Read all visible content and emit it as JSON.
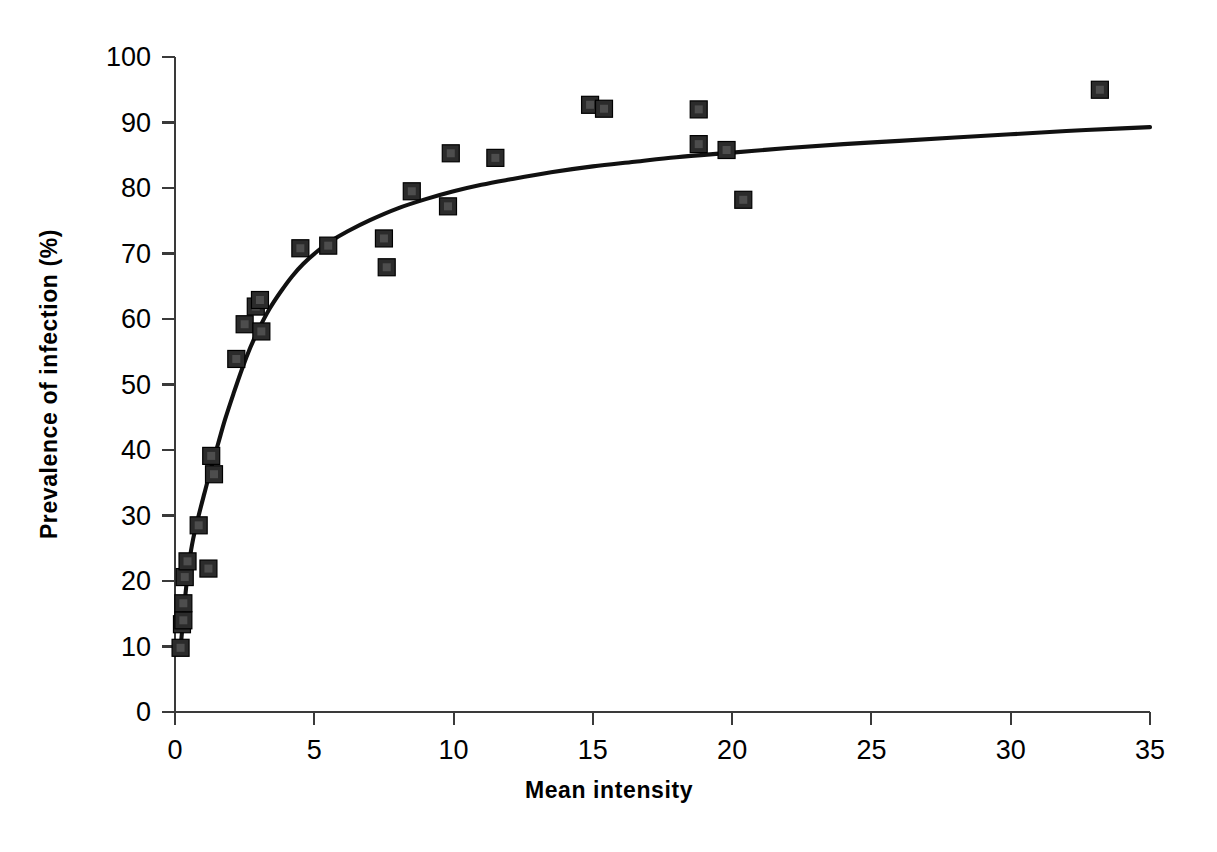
{
  "chart_data": {
    "type": "scatter",
    "title": "",
    "xlabel": "Mean intensity",
    "ylabel": "Prevalence of infection (%)",
    "xlim": [
      0,
      35
    ],
    "ylim": [
      0,
      100
    ],
    "xticks": [
      0,
      5,
      10,
      15,
      20,
      25,
      30,
      35
    ],
    "yticks": [
      0,
      10,
      20,
      30,
      40,
      50,
      60,
      70,
      80,
      90,
      100
    ],
    "xtick_labels": [
      "0",
      "5",
      "10",
      "15",
      "20",
      "25",
      "30",
      "35"
    ],
    "ytick_labels": [
      "0",
      "10",
      "20",
      "30",
      "40",
      "50",
      "60",
      "70",
      "80",
      "90",
      "100"
    ],
    "grid": false,
    "legend": null,
    "marker_style": "filled-square",
    "marker_color": "#2b2b2b",
    "curve_color": "#111111",
    "series": [
      {
        "name": "Observed sites",
        "type": "scatter",
        "points": [
          {
            "x": 0.2,
            "y": 9.8
          },
          {
            "x": 0.25,
            "y": 13.4
          },
          {
            "x": 0.3,
            "y": 14.0
          },
          {
            "x": 0.3,
            "y": 16.6
          },
          {
            "x": 0.35,
            "y": 20.6
          },
          {
            "x": 0.45,
            "y": 23.0
          },
          {
            "x": 0.85,
            "y": 28.5
          },
          {
            "x": 1.2,
            "y": 21.9
          },
          {
            "x": 1.3,
            "y": 39.1
          },
          {
            "x": 1.4,
            "y": 36.3
          },
          {
            "x": 2.2,
            "y": 53.9
          },
          {
            "x": 2.5,
            "y": 59.2
          },
          {
            "x": 2.9,
            "y": 61.9
          },
          {
            "x": 3.05,
            "y": 62.9
          },
          {
            "x": 3.1,
            "y": 58.1
          },
          {
            "x": 4.5,
            "y": 70.8
          },
          {
            "x": 5.5,
            "y": 71.2
          },
          {
            "x": 7.5,
            "y": 72.3
          },
          {
            "x": 7.6,
            "y": 67.9
          },
          {
            "x": 8.5,
            "y": 79.5
          },
          {
            "x": 9.8,
            "y": 77.2
          },
          {
            "x": 9.9,
            "y": 85.3
          },
          {
            "x": 11.5,
            "y": 84.6
          },
          {
            "x": 14.9,
            "y": 92.7
          },
          {
            "x": 15.4,
            "y": 92.1
          },
          {
            "x": 18.8,
            "y": 92.0
          },
          {
            "x": 18.8,
            "y": 86.7
          },
          {
            "x": 19.8,
            "y": 85.8
          },
          {
            "x": 20.4,
            "y": 78.2
          },
          {
            "x": 33.2,
            "y": 95.0
          }
        ]
      },
      {
        "name": "Fitted curve",
        "type": "line",
        "points": [
          {
            "x": 0.2,
            "y": 9.8
          },
          {
            "x": 0.3,
            "y": 14.5
          },
          {
            "x": 0.4,
            "y": 19.0
          },
          {
            "x": 0.5,
            "y": 22.6
          },
          {
            "x": 0.65,
            "y": 26.4
          },
          {
            "x": 0.85,
            "y": 30.0
          },
          {
            "x": 1.05,
            "y": 33.3
          },
          {
            "x": 1.3,
            "y": 37.3
          },
          {
            "x": 1.55,
            "y": 41.0
          },
          {
            "x": 1.8,
            "y": 44.7
          },
          {
            "x": 2.1,
            "y": 48.6
          },
          {
            "x": 2.4,
            "y": 52.3
          },
          {
            "x": 2.7,
            "y": 55.6
          },
          {
            "x": 3.0,
            "y": 58.4
          },
          {
            "x": 3.4,
            "y": 61.6
          },
          {
            "x": 3.8,
            "y": 64.2
          },
          {
            "x": 4.2,
            "y": 66.5
          },
          {
            "x": 4.6,
            "y": 68.4
          },
          {
            "x": 5.1,
            "y": 70.3
          },
          {
            "x": 5.6,
            "y": 71.9
          },
          {
            "x": 6.2,
            "y": 73.4
          },
          {
            "x": 7.0,
            "y": 75.1
          },
          {
            "x": 8.0,
            "y": 76.9
          },
          {
            "x": 9.0,
            "y": 78.3
          },
          {
            "x": 10.0,
            "y": 79.5
          },
          {
            "x": 11.0,
            "y": 80.5
          },
          {
            "x": 12.0,
            "y": 81.3
          },
          {
            "x": 13.5,
            "y": 82.4
          },
          {
            "x": 15.0,
            "y": 83.3
          },
          {
            "x": 16.5,
            "y": 84.0
          },
          {
            "x": 18.0,
            "y": 84.7
          },
          {
            "x": 20.0,
            "y": 85.4
          },
          {
            "x": 22.0,
            "y": 86.1
          },
          {
            "x": 24.0,
            "y": 86.7
          },
          {
            "x": 26.0,
            "y": 87.2
          },
          {
            "x": 28.0,
            "y": 87.7
          },
          {
            "x": 30.0,
            "y": 88.2
          },
          {
            "x": 32.0,
            "y": 88.7
          },
          {
            "x": 34.0,
            "y": 89.1
          },
          {
            "x": 35.0,
            "y": 89.3
          }
        ]
      }
    ]
  }
}
